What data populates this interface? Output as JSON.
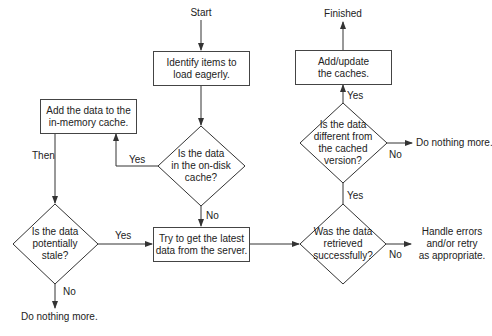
{
  "diagram": {
    "type": "flowchart",
    "nodes": {
      "start": "Start",
      "identify": [
        "Identify items to",
        "load eagerly."
      ],
      "on_disk": [
        "Is the data",
        "in the on-disk",
        "cache?"
      ],
      "add_memory": [
        "Add the data to the",
        "in-memory cache."
      ],
      "stale": [
        "Is the data",
        "potentially",
        "stale?"
      ],
      "try_get": [
        "Try to get the latest",
        "data from the server."
      ],
      "retrieved": [
        "Was the data",
        "retrieved",
        "successfully?"
      ],
      "different": [
        "Is the data",
        "different from",
        "the cached",
        "version?"
      ],
      "add_update": [
        "Add/update",
        "the caches."
      ],
      "finished": "Finished",
      "nothing_stale": "Do nothing more.",
      "nothing_diff": "Do nothing more.",
      "handle_errors": [
        "Handle errors",
        "and/or retry",
        "as appropriate."
      ]
    },
    "edge_labels": {
      "on_disk_yes": "Yes",
      "on_disk_no": "No",
      "then": "Then",
      "stale_yes": "Yes",
      "stale_no": "No",
      "retrieved_yes": "Yes",
      "retrieved_no": "No",
      "different_yes": "Yes",
      "different_no": "No"
    },
    "colors": {
      "line": "#333333",
      "text": "#222222",
      "background": "#ffffff"
    }
  }
}
